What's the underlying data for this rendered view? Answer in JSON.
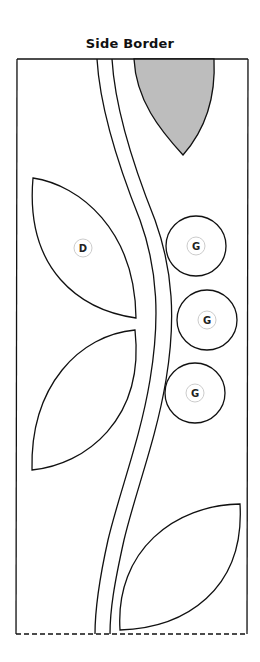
{
  "title": "Side Border",
  "colors": {
    "outline": "#111111",
    "shaded_leaf": "#bdbdbd",
    "label_ring": "#cccccc",
    "background": "#ffffff"
  },
  "pieces": {
    "leaf_d": {
      "label": "D"
    },
    "circles": [
      {
        "label": "G"
      },
      {
        "label": "G"
      },
      {
        "label": "G"
      }
    ]
  },
  "border": {
    "top_edge": "solid",
    "bottom_edge": "dashed"
  }
}
